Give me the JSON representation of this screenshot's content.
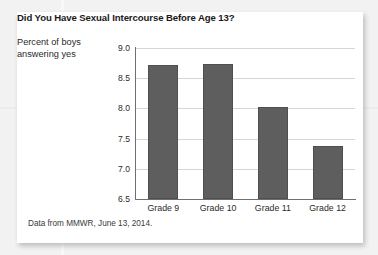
{
  "figure": {
    "title": "Did You Have Sexual Intercourse Before Age 13?",
    "y_axis_title_line1": "Percent of boys",
    "y_axis_title_line2": "answering yes",
    "source_note": "Data from MMWR, June 13, 2014.",
    "bar_color": "#5e5e5e",
    "gridline_color": "#d6d6d6",
    "axis_color": "#6f6f6f",
    "card_background": "#ffffff",
    "page_background": "#f2f2f2"
  },
  "chart_data": {
    "type": "bar",
    "title": "Did You Have Sexual Intercourse Before Age 13?",
    "categories": [
      "Grade 9",
      "Grade 10",
      "Grade 11",
      "Grade 12"
    ],
    "values": [
      8.72,
      8.73,
      8.02,
      7.37
    ],
    "series": [
      {
        "name": "Percent of boys answering yes",
        "values": [
          8.72,
          8.73,
          8.02,
          7.37
        ]
      }
    ],
    "xlabel": "",
    "ylabel": "Percent of boys answering yes",
    "ylim": [
      6.5,
      9.0
    ],
    "ytick_labels": [
      "9.0",
      "8.5",
      "8.0",
      "7.5",
      "7.0",
      "6.5"
    ],
    "ytick_values": [
      9.0,
      8.5,
      8.0,
      7.5,
      7.0,
      6.5
    ],
    "grid": true,
    "grid_axis": "y",
    "legend": "none",
    "annotation": "Data from MMWR, June 13, 2014."
  }
}
